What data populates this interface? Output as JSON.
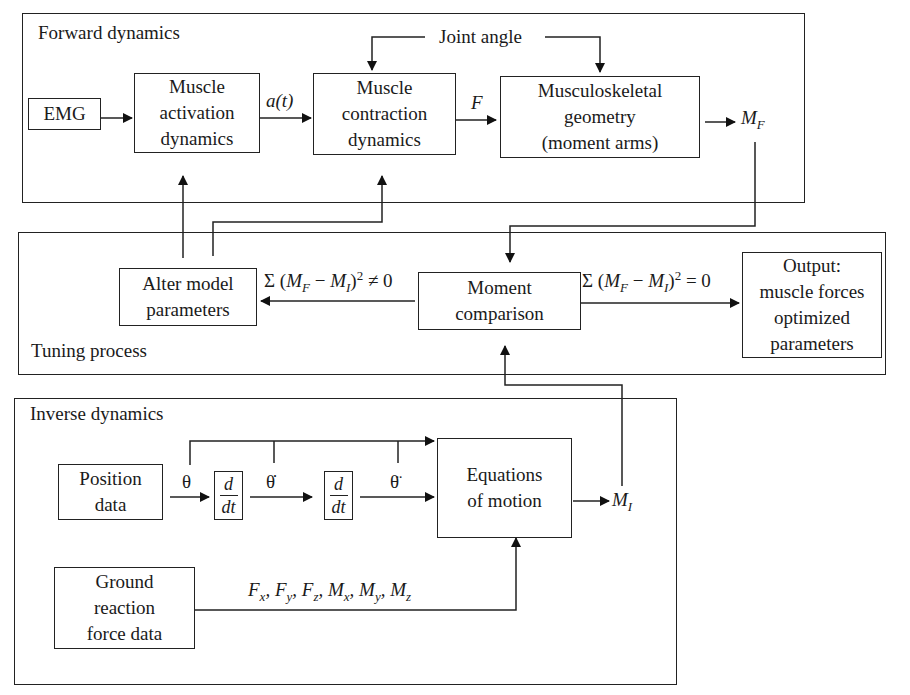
{
  "forward_dynamics": {
    "title": "Forward dynamics",
    "emg": "EMG",
    "activation": [
      "Muscle",
      "activation",
      "dynamics"
    ],
    "activation_signal": "a(t)",
    "contraction": [
      "Muscle",
      "contraction",
      "dynamics"
    ],
    "force_signal": "F",
    "geometry": [
      "Musculoskeletal",
      "geometry",
      "(moment arms)"
    ],
    "joint_angle": "Joint angle",
    "output_moment": "M",
    "output_moment_sub": "F"
  },
  "tuning_process": {
    "title": "Tuning process",
    "alter": [
      "Alter model",
      "parameters"
    ],
    "comparison": [
      "Moment",
      "comparison"
    ],
    "output": [
      "Output:",
      "muscle forces",
      "optimized",
      "parameters"
    ],
    "neq_condition": "Σ (M_F − M_I)² ≠ 0",
    "eq_condition": "Σ (M_F − M_I)² = 0"
  },
  "inverse_dynamics": {
    "title": "Inverse dynamics",
    "position": [
      "Position",
      "data"
    ],
    "theta": "θ",
    "theta_dot": "θ̇",
    "theta_ddot": "θ̈",
    "derivative_num": "d",
    "derivative_den": "dt",
    "equations": [
      "Equations",
      "of motion"
    ],
    "ground": [
      "Ground",
      "reaction",
      "force data"
    ],
    "grf_components": "Fx, Fy, Fz, Mx, My, Mz",
    "output_moment": "M",
    "output_moment_sub": "I"
  }
}
